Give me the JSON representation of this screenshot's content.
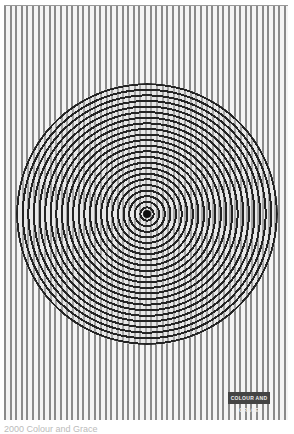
{
  "poster": {
    "pattern": "vertical-stripes",
    "circle_pattern": "concentric-rings",
    "colors": {
      "stripe": "#8a8a8a",
      "background": "#f4f4f4",
      "ring": "#222222"
    },
    "label": "COLOUR AND GRACE"
  },
  "caption": "2000 Colour and Grace"
}
